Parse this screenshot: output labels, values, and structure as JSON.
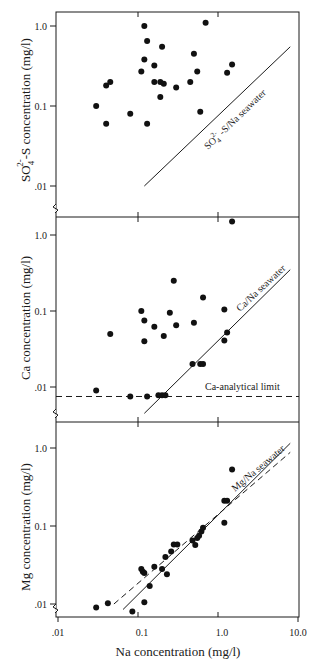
{
  "chart_data": [
    {
      "type": "scatter",
      "panel": "top",
      "xlabel": "Na concentration (mg/l)",
      "ylabel": "SO4 2- -S concentration (mg/l)",
      "ylabel_main": "SO",
      "ylabel_sub": "4",
      "ylabel_sup": "2-",
      "ylabel_rest": "-S concentration (mg/l)",
      "xscale": "log",
      "yscale": "log",
      "xlim": [
        0.01,
        10.0
      ],
      "ylim": [
        0.005,
        1.5
      ],
      "yticks": [
        0.01,
        0.1,
        1.0
      ],
      "ytick_labels": [
        ".01",
        "0.1",
        "1.0"
      ],
      "reference_line": {
        "label": "SO4 2- -S/Na seawater",
        "label_main": "SO",
        "label_sub": "4",
        "label_sup": "2-",
        "label_rest": " -S/Na seawater",
        "style": "solid",
        "x": [
          0.12,
          8.0
        ],
        "y": [
          0.01,
          0.55
        ]
      },
      "points": [
        {
          "x": 0.03,
          "y": 0.1
        },
        {
          "x": 0.04,
          "y": 0.18
        },
        {
          "x": 0.045,
          "y": 0.2
        },
        {
          "x": 0.04,
          "y": 0.06
        },
        {
          "x": 0.08,
          "y": 0.08
        },
        {
          "x": 0.12,
          "y": 1.0
        },
        {
          "x": 0.13,
          "y": 0.65
        },
        {
          "x": 0.12,
          "y": 0.38
        },
        {
          "x": 0.11,
          "y": 0.27
        },
        {
          "x": 0.16,
          "y": 0.32
        },
        {
          "x": 0.16,
          "y": 0.2
        },
        {
          "x": 0.19,
          "y": 0.2
        },
        {
          "x": 0.19,
          "y": 0.13
        },
        {
          "x": 0.21,
          "y": 0.19
        },
        {
          "x": 0.2,
          "y": 0.55
        },
        {
          "x": 0.13,
          "y": 0.06
        },
        {
          "x": 0.3,
          "y": 0.17
        },
        {
          "x": 0.45,
          "y": 0.2
        },
        {
          "x": 0.5,
          "y": 0.45
        },
        {
          "x": 0.55,
          "y": 0.27
        },
        {
          "x": 0.6,
          "y": 0.085
        },
        {
          "x": 0.7,
          "y": 1.1
        },
        {
          "x": 1.3,
          "y": 0.26
        },
        {
          "x": 1.5,
          "y": 0.33
        }
      ]
    },
    {
      "type": "scatter",
      "panel": "middle",
      "xlabel": "Na concentration (mg/l)",
      "ylabel": "Ca concentration (mg/l)",
      "xscale": "log",
      "yscale": "log",
      "xlim": [
        0.01,
        10.0
      ],
      "ylim": [
        0.005,
        1.7
      ],
      "yticks": [
        0.01,
        0.1,
        1.0
      ],
      "ytick_labels": [
        ".01",
        "0.1",
        "1.0"
      ],
      "reference_line": {
        "label": "Ca/Na seawater",
        "style": "solid",
        "x": [
          0.12,
          8.0
        ],
        "y": [
          0.0045,
          0.35
        ]
      },
      "limit_line": {
        "label": "Ca-analytical limit",
        "style": "dashed",
        "y": 0.0075
      },
      "points": [
        {
          "x": 0.03,
          "y": 0.009
        },
        {
          "x": 0.045,
          "y": 0.05
        },
        {
          "x": 0.08,
          "y": 0.0075
        },
        {
          "x": 0.11,
          "y": 0.1
        },
        {
          "x": 0.12,
          "y": 0.075
        },
        {
          "x": 0.12,
          "y": 0.04
        },
        {
          "x": 0.13,
          "y": 0.0075
        },
        {
          "x": 0.16,
          "y": 0.062
        },
        {
          "x": 0.18,
          "y": 0.0078
        },
        {
          "x": 0.2,
          "y": 0.0078
        },
        {
          "x": 0.22,
          "y": 0.0078
        },
        {
          "x": 0.21,
          "y": 0.047
        },
        {
          "x": 0.25,
          "y": 0.095
        },
        {
          "x": 0.28,
          "y": 0.25
        },
        {
          "x": 0.3,
          "y": 0.065
        },
        {
          "x": 0.48,
          "y": 0.02
        },
        {
          "x": 0.5,
          "y": 0.07
        },
        {
          "x": 0.6,
          "y": 0.02
        },
        {
          "x": 0.65,
          "y": 0.02
        },
        {
          "x": 0.65,
          "y": 0.15
        },
        {
          "x": 1.2,
          "y": 0.105
        },
        {
          "x": 1.2,
          "y": 0.041
        },
        {
          "x": 1.3,
          "y": 0.052
        },
        {
          "x": 1.5,
          "y": 1.5
        }
      ]
    },
    {
      "type": "scatter",
      "panel": "bottom",
      "xlabel": "Na concentration (mg/l)",
      "ylabel": "Mg concentration (mg/l)",
      "xscale": "log",
      "yscale": "log",
      "xlim": [
        0.01,
        10.0
      ],
      "ylim": [
        0.006,
        1.6
      ],
      "xticks": [
        0.01,
        0.1,
        1.0,
        10.0
      ],
      "xtick_labels": [
        ".01",
        "0.1",
        "1.0",
        "10.0"
      ],
      "yticks": [
        0.01,
        0.1,
        1.0
      ],
      "ytick_labels": [
        ".01",
        "0.1",
        "1.0"
      ],
      "reference_line": {
        "label": "Mg/Na seawater",
        "style": "solid",
        "x": [
          0.065,
          8.0
        ],
        "y": [
          0.0085,
          1.15
        ]
      },
      "fit_line": {
        "style": "dashed",
        "x": [
          0.05,
          8.0
        ],
        "y": [
          0.01,
          0.88
        ]
      },
      "points": [
        {
          "x": 0.03,
          "y": 0.009
        },
        {
          "x": 0.042,
          "y": 0.0102
        },
        {
          "x": 0.085,
          "y": 0.008
        },
        {
          "x": 0.11,
          "y": 0.028
        },
        {
          "x": 0.115,
          "y": 0.026
        },
        {
          "x": 0.12,
          "y": 0.0105
        },
        {
          "x": 0.12,
          "y": 0.025
        },
        {
          "x": 0.14,
          "y": 0.017
        },
        {
          "x": 0.16,
          "y": 0.03
        },
        {
          "x": 0.2,
          "y": 0.028
        },
        {
          "x": 0.22,
          "y": 0.04
        },
        {
          "x": 0.23,
          "y": 0.024
        },
        {
          "x": 0.26,
          "y": 0.047
        },
        {
          "x": 0.28,
          "y": 0.058
        },
        {
          "x": 0.31,
          "y": 0.058
        },
        {
          "x": 0.48,
          "y": 0.065
        },
        {
          "x": 0.52,
          "y": 0.057
        },
        {
          "x": 0.55,
          "y": 0.07
        },
        {
          "x": 0.58,
          "y": 0.075
        },
        {
          "x": 0.62,
          "y": 0.085
        },
        {
          "x": 0.65,
          "y": 0.095
        },
        {
          "x": 1.2,
          "y": 0.21
        },
        {
          "x": 1.3,
          "y": 0.21
        },
        {
          "x": 1.2,
          "y": 0.11
        },
        {
          "x": 1.5,
          "y": 0.53
        }
      ]
    }
  ],
  "labels": {
    "x_axis": "Na concentration (mg/l)",
    "top_ylabel_main": "SO",
    "top_ylabel_sub": "4",
    "top_ylabel_sup": "2-",
    "top_ylabel_rest": "-S concentration (mg/l)",
    "top_line_main": "SO",
    "top_line_sub": "4",
    "top_line_sup": "2-",
    "top_line_rest": " -S/Na seawater",
    "mid_ylabel": "Ca concentration (mg/l)",
    "mid_line": "Ca/Na seawater",
    "mid_limit": "Ca-analytical limit",
    "bot_ylabel": "Mg concentration (mg/l)",
    "bot_line": "Mg/Na seawater",
    "ytick_1": "1.0",
    "ytick_01": "0.1",
    "ytick_001": ".01",
    "xtick_001": ".01",
    "xtick_01": "0.1",
    "xtick_1": "1.0",
    "xtick_10": "10.0"
  }
}
